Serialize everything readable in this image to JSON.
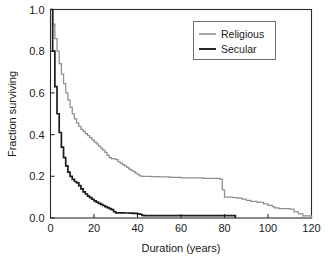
{
  "chart_data": {
    "type": "line",
    "title": "",
    "xlabel": "Duration (years)",
    "ylabel": "Fraction surviving",
    "xlim": [
      0,
      120
    ],
    "ylim": [
      0.0,
      1.0
    ],
    "xticks": [
      0,
      20,
      40,
      60,
      80,
      100,
      120
    ],
    "xtick_labels": [
      "0",
      "20",
      "40",
      "60",
      "80",
      "100",
      "120"
    ],
    "yticks": [
      0.0,
      0.2,
      0.4,
      0.6,
      0.8,
      1.0
    ],
    "ytick_labels": [
      "0.0",
      "0.2",
      "0.4",
      "0.6",
      "0.8",
      "1.0"
    ],
    "grid": false,
    "legend_position": "upper-right",
    "step_style": "post",
    "series": [
      {
        "name": "Religious",
        "color": "#8e8e8e",
        "x": [
          0,
          1,
          2,
          3,
          4,
          5,
          6,
          7,
          8,
          9,
          10,
          11,
          12,
          13,
          14,
          15,
          16,
          17,
          18,
          19,
          20,
          21,
          22,
          23,
          24,
          25,
          26,
          27,
          28,
          29,
          30,
          31,
          32,
          33,
          34,
          35,
          36,
          37,
          38,
          39,
          40,
          41,
          42,
          44,
          46,
          48,
          50,
          55,
          60,
          65,
          70,
          74,
          76,
          77,
          78,
          79,
          80,
          82,
          84,
          86,
          88,
          90,
          92,
          95,
          98,
          100,
          102,
          103,
          105,
          107,
          110,
          112,
          114,
          116,
          120
        ],
        "y": [
          1.0,
          0.93,
          0.86,
          0.8,
          0.74,
          0.69,
          0.645,
          0.6,
          0.565,
          0.53,
          0.5,
          0.475,
          0.455,
          0.44,
          0.425,
          0.415,
          0.405,
          0.395,
          0.385,
          0.375,
          0.365,
          0.355,
          0.345,
          0.335,
          0.325,
          0.315,
          0.3,
          0.29,
          0.285,
          0.283,
          0.28,
          0.27,
          0.263,
          0.256,
          0.25,
          0.243,
          0.235,
          0.228,
          0.222,
          0.215,
          0.208,
          0.202,
          0.2,
          0.2,
          0.199,
          0.198,
          0.197,
          0.195,
          0.193,
          0.192,
          0.19,
          0.19,
          0.19,
          0.19,
          0.185,
          0.135,
          0.1,
          0.1,
          0.098,
          0.095,
          0.09,
          0.085,
          0.08,
          0.075,
          0.068,
          0.06,
          0.055,
          0.048,
          0.045,
          0.045,
          0.042,
          0.03,
          0.02,
          0.01,
          0.0
        ]
      },
      {
        "name": "Secular",
        "color": "#1c1c1c",
        "x": [
          0,
          1,
          2,
          3,
          4,
          5,
          6,
          7,
          8,
          9,
          10,
          11,
          12,
          13,
          14,
          15,
          16,
          17,
          18,
          19,
          20,
          21,
          22,
          23,
          24,
          25,
          26,
          27,
          28,
          29,
          30,
          32,
          34,
          36,
          38,
          40,
          41,
          42,
          43,
          50,
          60,
          70,
          80,
          84,
          85
        ],
        "y": [
          1.0,
          0.8,
          0.63,
          0.5,
          0.41,
          0.34,
          0.29,
          0.25,
          0.22,
          0.2,
          0.185,
          0.175,
          0.168,
          0.155,
          0.14,
          0.125,
          0.115,
          0.105,
          0.098,
          0.09,
          0.082,
          0.076,
          0.07,
          0.065,
          0.06,
          0.055,
          0.05,
          0.045,
          0.04,
          0.03,
          0.025,
          0.025,
          0.024,
          0.023,
          0.022,
          0.02,
          0.018,
          0.013,
          0.011,
          0.011,
          0.011,
          0.011,
          0.011,
          0.011,
          0.0
        ]
      }
    ]
  },
  "axes": {
    "x_title": "Duration (years)",
    "y_title": "Fraction surviving",
    "x_tick_labels": [
      "0",
      "20",
      "40",
      "60",
      "80",
      "100",
      "120"
    ],
    "y_tick_labels": [
      "0.0",
      "0.2",
      "0.4",
      "0.6",
      "0.8",
      "1.0"
    ]
  },
  "legend": {
    "entries": [
      {
        "label": "Religious",
        "color": "#8e8e8e"
      },
      {
        "label": "Secular",
        "color": "#1c1c1c"
      }
    ]
  },
  "colors": {
    "religious": "#8e8e8e",
    "secular": "#1c1c1c",
    "frame": "#2b2b2b",
    "background": "#ffffff",
    "legend_border": "#6e6e6e"
  }
}
